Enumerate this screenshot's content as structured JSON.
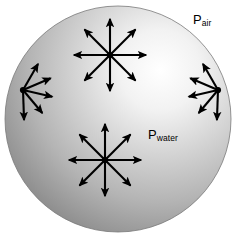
{
  "figure": {
    "background_color": "#ffffff",
    "width": 242,
    "height": 235
  },
  "sphere": {
    "name": "water-droplet",
    "cx": 118,
    "cy": 119,
    "r": 113,
    "highlight_x": 160,
    "highlight_y": 70,
    "highlight_color": "#ffffff",
    "mid_color": "#c9c9c9",
    "edge_color": "#8a8a8a",
    "outline_color": "#7a7a7a"
  },
  "labels": {
    "p_air": {
      "base": "P",
      "subscript": "air"
    },
    "p_water": {
      "base": "P",
      "subscript": "water"
    }
  },
  "arrow_color": "#000000",
  "arrow_groups": [
    {
      "name": "starburst-top",
      "kind": "starburst",
      "cx": 110,
      "cy": 55,
      "count": 8,
      "length": 36,
      "angles_deg": [
        0,
        45,
        90,
        135,
        180,
        225,
        270,
        315
      ]
    },
    {
      "name": "starburst-bottom",
      "kind": "starburst",
      "cx": 105,
      "cy": 160,
      "count": 8,
      "length": 36,
      "angles_deg": [
        0,
        45,
        90,
        135,
        180,
        225,
        270,
        315
      ]
    },
    {
      "name": "fan-left-surface",
      "kind": "fan",
      "cx": 23,
      "cy": 90,
      "count": 5,
      "length": 30,
      "angles_deg": [
        300,
        337,
        13,
        50,
        88
      ]
    },
    {
      "name": "fan-right-surface",
      "kind": "fan",
      "cx": 218,
      "cy": 90,
      "count": 5,
      "length": 30,
      "angles_deg": [
        240,
        203,
        167,
        130,
        92
      ]
    }
  ]
}
